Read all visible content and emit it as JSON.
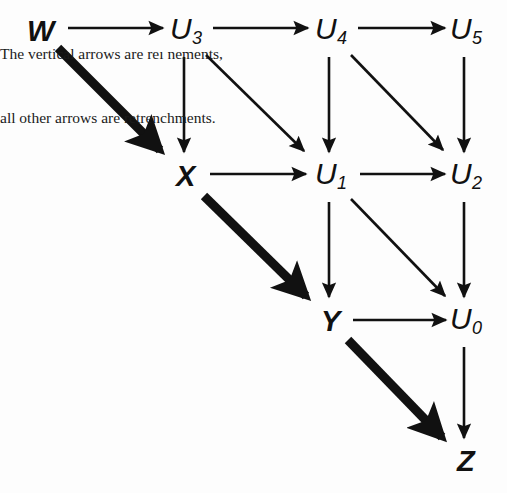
{
  "diagram": {
    "background_color": "#fdfdfd",
    "ink_color": "#111111",
    "nodes": [
      {
        "id": "W",
        "label": "W",
        "kind": "terminal",
        "x": 41,
        "y": 31
      },
      {
        "id": "U3",
        "label": "U",
        "sub": "3",
        "kind": "uvar",
        "x": 186,
        "y": 31
      },
      {
        "id": "U4",
        "label": "U",
        "sub": "4",
        "kind": "uvar",
        "x": 331,
        "y": 31
      },
      {
        "id": "U5",
        "label": "U",
        "sub": "5",
        "kind": "uvar",
        "x": 466,
        "y": 31
      },
      {
        "id": "X",
        "label": "X",
        "kind": "terminal",
        "x": 186,
        "y": 176
      },
      {
        "id": "U1",
        "label": "U",
        "sub": "1",
        "kind": "uvar",
        "x": 331,
        "y": 176
      },
      {
        "id": "U2",
        "label": "U",
        "sub": "2",
        "kind": "uvar",
        "x": 466,
        "y": 176
      },
      {
        "id": "Y",
        "label": "Y",
        "kind": "terminal",
        "x": 331,
        "y": 321
      },
      {
        "id": "U0",
        "label": "U",
        "sub": "0",
        "kind": "uvar",
        "x": 466,
        "y": 321
      },
      {
        "id": "Z",
        "label": "Z",
        "kind": "terminal",
        "x": 466,
        "y": 461
      }
    ],
    "edges": [
      {
        "from": "W",
        "to": "U3",
        "style": "thin",
        "orientation": "horizontal",
        "x1": 68,
        "y1": 28,
        "x2": 163,
        "y2": 28
      },
      {
        "from": "U3",
        "to": "U4",
        "style": "thin",
        "orientation": "horizontal",
        "x1": 213,
        "y1": 28,
        "x2": 308,
        "y2": 28
      },
      {
        "from": "U4",
        "to": "U5",
        "style": "thin",
        "orientation": "horizontal",
        "x1": 358,
        "y1": 28,
        "x2": 445,
        "y2": 28
      },
      {
        "from": "X",
        "to": "U1",
        "style": "thin",
        "orientation": "horizontal",
        "x1": 210,
        "y1": 174,
        "x2": 306,
        "y2": 174
      },
      {
        "from": "U1",
        "to": "U2",
        "style": "thin",
        "orientation": "horizontal",
        "x1": 360,
        "y1": 174,
        "x2": 445,
        "y2": 174
      },
      {
        "from": "Y",
        "to": "U0",
        "style": "thin",
        "orientation": "horizontal",
        "x1": 353,
        "y1": 320,
        "x2": 446,
        "y2": 320
      },
      {
        "from": "U3",
        "to": "X",
        "style": "thin",
        "orientation": "vertical",
        "x1": 184,
        "y1": 57,
        "x2": 184,
        "y2": 152
      },
      {
        "from": "U4",
        "to": "U1",
        "style": "thin",
        "orientation": "vertical",
        "x1": 329,
        "y1": 57,
        "x2": 329,
        "y2": 152
      },
      {
        "from": "U5",
        "to": "U2",
        "style": "thin",
        "orientation": "vertical",
        "x1": 464,
        "y1": 57,
        "x2": 464,
        "y2": 152
      },
      {
        "from": "U1",
        "to": "Y",
        "style": "thin",
        "orientation": "vertical",
        "x1": 329,
        "y1": 202,
        "x2": 329,
        "y2": 297
      },
      {
        "from": "U2",
        "to": "U0",
        "style": "thin",
        "orientation": "vertical",
        "x1": 464,
        "y1": 202,
        "x2": 464,
        "y2": 297
      },
      {
        "from": "U0",
        "to": "Z",
        "style": "thin",
        "orientation": "vertical",
        "x1": 464,
        "y1": 347,
        "x2": 464,
        "y2": 438
      },
      {
        "from": "U3",
        "to": "U1",
        "style": "thin",
        "orientation": "diagonal",
        "x1": 206,
        "y1": 55,
        "x2": 304,
        "y2": 151
      },
      {
        "from": "U4",
        "to": "U2",
        "style": "thin",
        "orientation": "diagonal",
        "x1": 351,
        "y1": 55,
        "x2": 443,
        "y2": 150
      },
      {
        "from": "U1",
        "to": "U0",
        "style": "thin",
        "orientation": "diagonal",
        "x1": 351,
        "y1": 199,
        "x2": 445,
        "y2": 296
      },
      {
        "from": "W",
        "to": "X",
        "style": "thick",
        "orientation": "diagonal",
        "x1": 58,
        "y1": 48,
        "x2": 160,
        "y2": 150
      },
      {
        "from": "X",
        "to": "Y",
        "style": "thick",
        "orientation": "diagonal",
        "x1": 204,
        "y1": 196,
        "x2": 306,
        "y2": 296
      },
      {
        "from": "Y",
        "to": "Z",
        "style": "thick",
        "orientation": "diagonal",
        "x1": 348,
        "y1": 340,
        "x2": 442,
        "y2": 437
      }
    ],
    "caption": {
      "line1": "The vertical arrows are reı nements,",
      "line2": "all other arrows are retrenchments.",
      "x": 8,
      "y": 381
    }
  }
}
